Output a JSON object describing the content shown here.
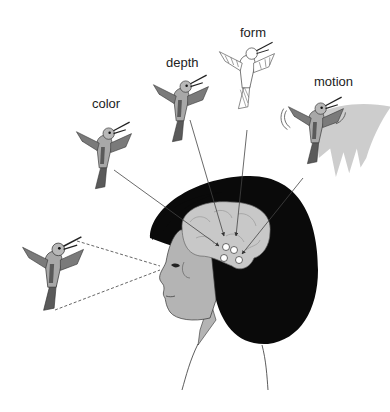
{
  "figure": {
    "labels": {
      "color": "color",
      "depth": "depth",
      "form": "form",
      "motion": "motion"
    },
    "colors": {
      "hair": "#0a0a0a",
      "skin": "#b4b4b4",
      "brain": "#c8c8c8",
      "bird_body": "#a8a8a8",
      "bird_dark": "#5a5a5a",
      "line": "#444444"
    }
  }
}
